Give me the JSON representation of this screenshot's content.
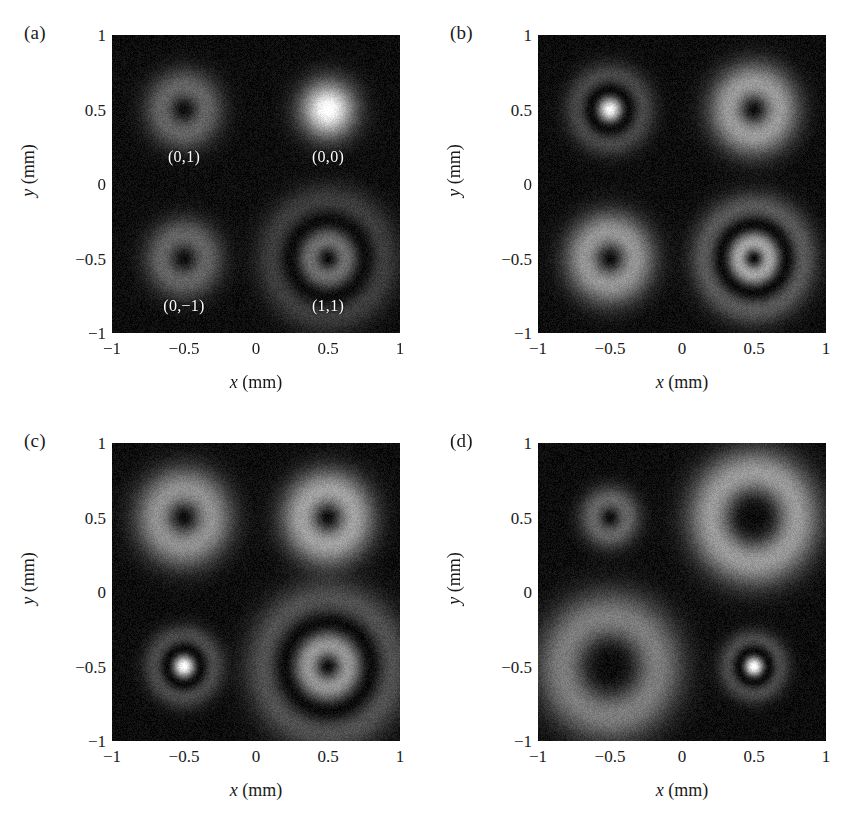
{
  "figure": {
    "width": 852,
    "height": 821,
    "background": "#ffffff",
    "text_color": "#1a1a1a",
    "label_color": "#ffffff"
  },
  "axes": {
    "xlabel_var": "x",
    "xlabel_unit": "(mm)",
    "ylabel_var": "y",
    "ylabel_unit": "(mm)",
    "xticks": [
      "-1",
      "-0.5",
      "0",
      "0.5",
      "1"
    ],
    "yticks": [
      "1",
      "0.5",
      "0",
      "-0.5",
      "-1"
    ],
    "xlim": [
      -1,
      1
    ],
    "ylim": [
      -1,
      1
    ]
  },
  "chart_data": {
    "type": "heatmap",
    "title": "",
    "xlabel": "x (mm)",
    "ylabel": "y (mm)",
    "xlim": [
      -1,
      1
    ],
    "ylim": [
      -1,
      1
    ],
    "xticks": [
      -1,
      -0.5,
      0,
      0.5,
      1
    ],
    "yticks": [
      -1,
      -0.5,
      0,
      0.5,
      1
    ],
    "grid": false,
    "legend": "none",
    "colormap": "grayscale",
    "intensity_range": [
      0,
      1
    ],
    "background_level": 0.03,
    "noise_level": 0.05,
    "panels": [
      {
        "letter": "(a)",
        "spots": [
          {
            "mode_label": "(0,1)",
            "label_x": -0.5,
            "label_y": 0.18,
            "center": [
              -0.5,
              0.5
            ],
            "p": 0,
            "l": 1,
            "waist": 0.22,
            "peak": 0.3
          },
          {
            "mode_label": "(0,0)",
            "label_x": 0.5,
            "label_y": 0.18,
            "center": [
              0.5,
              0.5
            ],
            "p": 0,
            "l": 0,
            "waist": 0.24,
            "peak": 1.0
          },
          {
            "mode_label": "(0,-1)",
            "label_x": -0.5,
            "label_y": -0.82,
            "center": [
              -0.5,
              -0.5
            ],
            "p": 0,
            "l": 1,
            "waist": 0.22,
            "peak": 0.3
          },
          {
            "mode_label": "(1,1)",
            "label_x": 0.5,
            "label_y": -0.82,
            "center": [
              0.5,
              -0.5
            ],
            "p": 1,
            "l": 1,
            "waist": 0.26,
            "peak": 0.34
          }
        ]
      },
      {
        "letter": "(b)",
        "spots": [
          {
            "mode_label": "",
            "center": [
              -0.5,
              0.5
            ],
            "p": 1,
            "l": 0,
            "waist": 0.19,
            "peak": 0.95
          },
          {
            "mode_label": "",
            "center": [
              0.5,
              0.5
            ],
            "p": 0,
            "l": 1,
            "waist": 0.25,
            "peak": 0.52
          },
          {
            "mode_label": "",
            "center": [
              -0.5,
              -0.5
            ],
            "p": 0,
            "l": 1,
            "waist": 0.25,
            "peak": 0.5
          },
          {
            "mode_label": "",
            "center": [
              0.5,
              -0.5
            ],
            "p": 1,
            "l": 1,
            "waist": 0.23,
            "peak": 0.56
          }
        ]
      },
      {
        "letter": "(c)",
        "spots": [
          {
            "mode_label": "",
            "center": [
              -0.5,
              0.5
            ],
            "p": 0,
            "l": 1,
            "waist": 0.27,
            "peak": 0.48
          },
          {
            "mode_label": "",
            "center": [
              0.5,
              0.5
            ],
            "p": 0,
            "l": 1,
            "waist": 0.26,
            "peak": 0.55
          },
          {
            "mode_label": "",
            "center": [
              -0.5,
              -0.5
            ],
            "p": 1,
            "l": 0,
            "waist": 0.17,
            "peak": 1.0
          },
          {
            "mode_label": "",
            "center": [
              0.5,
              -0.5
            ],
            "p": 1,
            "l": 1,
            "waist": 0.3,
            "peak": 0.5
          }
        ]
      },
      {
        "letter": "(d)",
        "spots": [
          {
            "mode_label": "",
            "center": [
              -0.5,
              0.5
            ],
            "p": 0,
            "l": 1,
            "waist": 0.17,
            "peak": 0.3
          },
          {
            "mode_label": "",
            "center": [
              0.5,
              0.5
            ],
            "p": 0,
            "l": 2,
            "waist": 0.3,
            "peak": 0.52
          },
          {
            "mode_label": "",
            "center": [
              -0.5,
              -0.5
            ],
            "p": 0,
            "l": 2,
            "waist": 0.33,
            "peak": 0.4
          },
          {
            "mode_label": "",
            "center": [
              0.5,
              -0.5
            ],
            "p": 1,
            "l": 0,
            "waist": 0.15,
            "peak": 1.0
          }
        ]
      }
    ]
  }
}
